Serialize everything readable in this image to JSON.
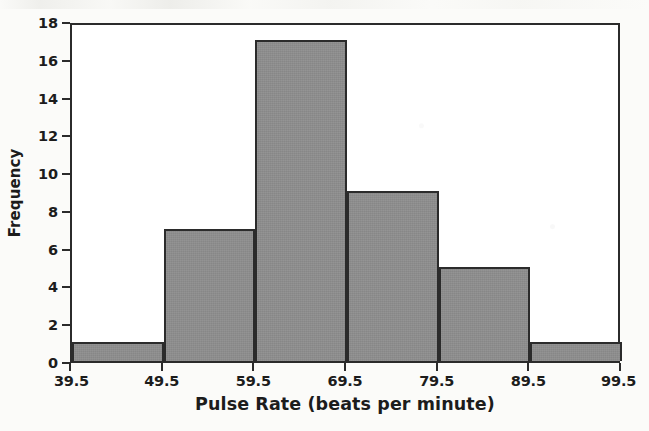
{
  "chart_data": {
    "type": "bar",
    "subtype": "histogram",
    "title": "",
    "xlabel": "Pulse Rate (beats per minute)",
    "ylabel": "Frequency",
    "categories": [
      "39.5-49.5",
      "49.5-59.5",
      "59.5-69.5",
      "69.5-79.5",
      "79.5-89.5",
      "89.5-99.5"
    ],
    "bin_edges": [
      39.5,
      49.5,
      59.5,
      69.5,
      79.5,
      89.5,
      99.5
    ],
    "values": [
      1,
      7,
      17,
      9,
      5,
      1
    ],
    "total_frequency": 40,
    "bin_width": 10,
    "xlim": [
      39.5,
      99.5
    ],
    "ylim": [
      0,
      18
    ],
    "xticks": [
      "39.5",
      "49.5",
      "59.5",
      "69.5",
      "79.5",
      "89.5",
      "99.5"
    ],
    "yticks": [
      "0",
      "2",
      "4",
      "6",
      "8",
      "10",
      "12",
      "14",
      "16",
      "18"
    ],
    "ytick_values": [
      0,
      2,
      4,
      6,
      8,
      10,
      12,
      14,
      16,
      18
    ],
    "grid": false,
    "legend": false,
    "bar_fill_color": "#8c8c8c",
    "bar_edge_color": "#2b2b2b",
    "plot_background_color": "#ffffff",
    "page_background_color": "#fbfbf9",
    "text_color": "#1c1c1c"
  }
}
